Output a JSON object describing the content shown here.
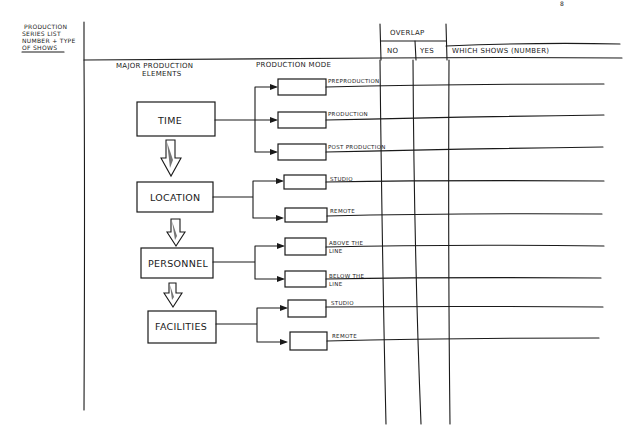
{
  "page_mark": "8",
  "left_header": {
    "lines": [
      "PRODUCTION",
      "SERIES LIST",
      "NUMBER + TYPE",
      "OF SHOWS"
    ]
  },
  "overlap_header": {
    "title": "OVERLAP",
    "no": "NO",
    "yes": "YES",
    "which_shows": "WHICH SHOWS (NUMBER)"
  },
  "column_headers": {
    "elements": [
      "MAJOR PRODUCTION",
      "ELEMENTS"
    ],
    "mode": "PRODUCTION MODE"
  },
  "elements": [
    {
      "label": "TIME",
      "modes": [
        "PREPRODUCTION",
        "PRODUCTION",
        "POST PRODUCTION"
      ]
    },
    {
      "label": "LOCATION",
      "modes": [
        "STUDIO",
        "REMOTE"
      ]
    },
    {
      "label": "PERSONNEL",
      "modes": [
        "ABOVE THE LINE",
        "BELOW THE LINE"
      ]
    },
    {
      "label": "FACILITIES",
      "modes": [
        "STUDIO",
        "REMOTE"
      ]
    }
  ],
  "mode_labels_wrapped": {
    "above": [
      "ABOVE THE",
      "LINE"
    ],
    "below": [
      "BELOW THE",
      "LINE"
    ]
  }
}
